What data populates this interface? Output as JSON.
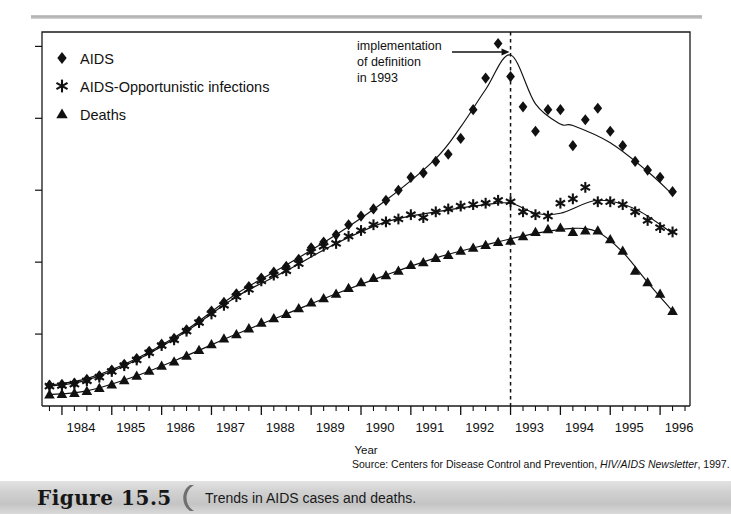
{
  "figure": {
    "number_label": "Figure 15.5",
    "caption": "Trends in AIDS cases and deaths.",
    "source_prefix": "Source: Centers for Disease Control and Prevention, ",
    "source_italic": "HIV/AIDS Newsletter",
    "source_suffix": ", 1997."
  },
  "annotation": {
    "line1": "implementation",
    "line2": "of definition",
    "line3": "in 1993",
    "marker_year": 1993.0,
    "arrow_name": "annotation-arrow"
  },
  "colors": {
    "ink": "#111111",
    "frame": "#1a1a1a",
    "band_gray": "#d2d2d2",
    "rule_gray": "#b9b9b9"
  },
  "chart_data": {
    "type": "scatter",
    "title": "Trends in AIDS cases and deaths.",
    "xlabel": "Year",
    "ylabel": "",
    "xlim": [
      1983.6,
      1996.6
    ],
    "ylim": [
      0,
      26000
    ],
    "grid": false,
    "legend_position": "top-left",
    "xticks": [
      1984,
      1985,
      1986,
      1987,
      1988,
      1989,
      1990,
      1991,
      1992,
      1993,
      1994,
      1995,
      1996
    ],
    "xtick_labels": [
      "1984",
      "1985",
      "1986",
      "1987",
      "1988",
      "1989",
      "1990",
      "1991",
      "1992",
      "1993",
      "1994",
      "1995",
      "1996"
    ],
    "yticks": [
      0,
      5000,
      10000,
      15000,
      20000,
      25000
    ],
    "ytick_labels": [
      "",
      "",
      "",
      "",
      "",
      ""
    ],
    "minor_ticks_per_year": 4,
    "legend": [
      {
        "name": "AIDS",
        "marker": "diamond"
      },
      {
        "name": "AIDS-Opportunistic infections",
        "marker": "asterisk"
      },
      {
        "name": "Deaths",
        "marker": "triangle"
      }
    ],
    "x": [
      1983.75,
      1984.0,
      1984.25,
      1984.5,
      1984.75,
      1985.0,
      1985.25,
      1985.5,
      1985.75,
      1986.0,
      1986.25,
      1986.5,
      1986.75,
      1987.0,
      1987.25,
      1987.5,
      1987.75,
      1988.0,
      1988.25,
      1988.5,
      1988.75,
      1989.0,
      1989.25,
      1989.5,
      1989.75,
      1990.0,
      1990.25,
      1990.5,
      1990.75,
      1991.0,
      1991.25,
      1991.5,
      1991.75,
      1992.0,
      1992.25,
      1992.5,
      1992.75,
      1993.0,
      1993.25,
      1993.5,
      1993.75,
      1994.0,
      1994.25,
      1994.5,
      1994.75,
      1995.0,
      1995.25,
      1995.5,
      1995.75,
      1996.0,
      1996.25
    ],
    "series": [
      {
        "name": "AIDS",
        "marker": "diamond",
        "values": [
          1450,
          1500,
          1600,
          1850,
          2100,
          2500,
          2900,
          3300,
          3800,
          4300,
          4700,
          5300,
          5900,
          6600,
          7200,
          7800,
          8300,
          8900,
          9300,
          9700,
          10200,
          11000,
          11400,
          11900,
          12600,
          13200,
          13700,
          14300,
          15000,
          15900,
          16200,
          17000,
          17500,
          18600,
          20600,
          22800,
          25200,
          22900,
          20800,
          19100,
          20600,
          20600,
          18100,
          19900,
          20700,
          19100,
          18100,
          17000,
          16400,
          15900,
          14900
        ]
      },
      {
        "name": "AIDS-Opportunistic infections",
        "marker": "asterisk",
        "values": [
          1380,
          1420,
          1520,
          1750,
          2000,
          2400,
          2800,
          3200,
          3700,
          4200,
          4600,
          5200,
          5800,
          6400,
          7000,
          7600,
          8100,
          8700,
          9100,
          9400,
          9900,
          10700,
          11100,
          11300,
          11800,
          12200,
          12600,
          12800,
          13000,
          13300,
          13100,
          13500,
          13700,
          13900,
          14000,
          14100,
          14300,
          14200,
          13500,
          13300,
          13200,
          14100,
          14400,
          15200,
          14200,
          14200,
          14000,
          13500,
          12900,
          12400,
          12100
        ]
      },
      {
        "name": "Deaths",
        "marker": "triangle",
        "values": [
          800,
          830,
          900,
          1050,
          1250,
          1500,
          1800,
          2100,
          2450,
          2800,
          3100,
          3500,
          3900,
          4300,
          4700,
          5000,
          5400,
          5800,
          6100,
          6400,
          6800,
          7200,
          7500,
          7800,
          8200,
          8600,
          8900,
          9100,
          9400,
          9800,
          10000,
          10300,
          10500,
          10800,
          11000,
          11200,
          11400,
          11500,
          11800,
          12100,
          12300,
          12400,
          12100,
          12200,
          12200,
          11600,
          10800,
          9400,
          8600,
          7800,
          6600
        ]
      }
    ],
    "trend_lines": [
      {
        "name": "AIDS",
        "x": [
          1983.75,
          1984.5,
          1985.5,
          1986.5,
          1987.5,
          1988.5,
          1989.5,
          1990.5,
          1991.5,
          1992.0,
          1992.5,
          1993.0,
          1993.5,
          1994.0,
          1994.25,
          1995.0,
          1995.75,
          1996.25
        ],
        "y": [
          1450,
          1900,
          3300,
          5300,
          7800,
          9800,
          11900,
          14300,
          17200,
          19400,
          22000,
          24400,
          21000,
          19600,
          19500,
          18300,
          16300,
          14700
        ]
      },
      {
        "name": "AIDS-Opportunistic infections",
        "x": [
          1983.75,
          1984.5,
          1985.5,
          1986.5,
          1987.5,
          1988.5,
          1989.5,
          1990.5,
          1991.5,
          1992.5,
          1993.0,
          1993.5,
          1994.0,
          1994.75,
          1995.5,
          1996.25
        ],
        "y": [
          1380,
          1800,
          3200,
          5200,
          7600,
          9400,
          11300,
          12800,
          13500,
          14000,
          14100,
          13400,
          13400,
          14300,
          13700,
          12000
        ]
      },
      {
        "name": "Deaths",
        "x": [
          1983.75,
          1984.5,
          1985.5,
          1986.5,
          1987.5,
          1988.5,
          1989.5,
          1990.5,
          1991.5,
          1992.5,
          1993.5,
          1994.25,
          1994.75,
          1995.25,
          1995.75,
          1996.25
        ],
        "y": [
          800,
          1050,
          2100,
          3500,
          5000,
          6400,
          7800,
          9100,
          10300,
          11200,
          12000,
          12350,
          12100,
          10700,
          8600,
          6600
        ]
      }
    ]
  }
}
